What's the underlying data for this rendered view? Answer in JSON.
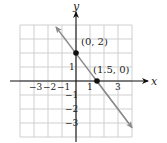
{
  "chart_data": {
    "type": "line",
    "title": "",
    "xlabel": "x",
    "ylabel": "y",
    "xlim": [
      -4,
      4
    ],
    "ylim": [
      -4,
      4
    ],
    "grid": true,
    "x_tick_labels": [
      "−3",
      "−2",
      "−1",
      "1",
      "3"
    ],
    "x_tick_values": [
      -3,
      -2,
      -1,
      1,
      3
    ],
    "y_tick_labels": [
      "1",
      "−1",
      "−2",
      "−3"
    ],
    "y_tick_values": [
      1,
      -1,
      -2,
      -3
    ],
    "series": [
      {
        "name": "line",
        "equation": "y = -4/3 x + 2",
        "x": [
          -1.5,
          4
        ],
        "y": [
          4,
          -3.33
        ],
        "color": "#8a8a8a",
        "arrows": "both"
      }
    ],
    "points": [
      {
        "x": 0,
        "y": 2,
        "label": "(0, 2)"
      },
      {
        "x": 1.5,
        "y": 0,
        "label": "(1.5, 0)"
      }
    ],
    "colors": {
      "axis": "#111111",
      "grid": "#cfcfcf",
      "line": "#8a8a8a",
      "point": "#111111"
    }
  }
}
